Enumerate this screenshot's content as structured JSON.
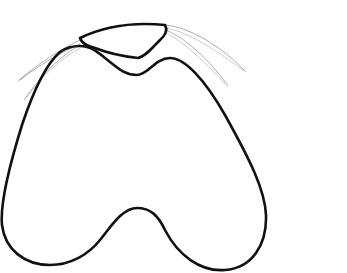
{
  "figure": {
    "background": "#ffffff",
    "stroke_color": "#111111",
    "fiber_color": "#777777"
  }
}
